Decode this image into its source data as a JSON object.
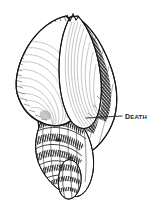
{
  "figure": {
    "type": "engraving-illustration",
    "subject_detail": "spiral gastropod shell (whelk / conch) shown aperture-side, drawn in black-and-white crosshatch engraving style",
    "background_color": "#ffffff",
    "ink_color": "#1a1a1a",
    "width": 158,
    "height": 211
  },
  "annotations": {
    "callouts": [
      {
        "label": "Death",
        "label_style": "small-caps",
        "color": "#1a1a1a",
        "label_x": 125,
        "label_y": 110,
        "leader_line": {
          "from_x": 122,
          "from_y": 116,
          "to_x": 86,
          "to_y": 118
        },
        "target": "point on the body whorl of the shell"
      }
    ]
  },
  "shell": {
    "outline_color": "#1a1a1a",
    "fill_color": "#ffffff",
    "apex_y": 14,
    "tip_y": 196,
    "left_x": 12,
    "right_x": 118,
    "parts": [
      {
        "name": "aperture-lip",
        "shading": "fine parallel hatching"
      },
      {
        "name": "body-whorl",
        "shading": "dense crosshatching"
      },
      {
        "name": "spire-whorls",
        "shading": "ribbed crosshatching"
      },
      {
        "name": "siphonal-canal",
        "shading": "dense crosshatching"
      }
    ]
  }
}
